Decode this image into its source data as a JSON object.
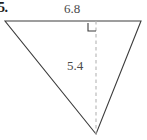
{
  "figure": {
    "problem_number": "5.",
    "shape": "triangle",
    "orientation": "downward-pointing",
    "background_color": "#ffffff",
    "outline_color": "#3c3c3c",
    "dashed_line_color": "#b5b5b5",
    "label_color": "#4a4a4a",
    "labels": {
      "base_length": "6.8",
      "height_length": "5.4"
    },
    "markers": {
      "right_angle": "right-angle-marker"
    },
    "geometry": {
      "top_left_vertex": "5,21",
      "top_right_vertex": "141,21",
      "bottom_vertex": "96,134",
      "altitude_foot": "96,21",
      "altitude_path": "96,21 96,134",
      "right_angle_path": "88,23 88,31 96,31"
    }
  }
}
